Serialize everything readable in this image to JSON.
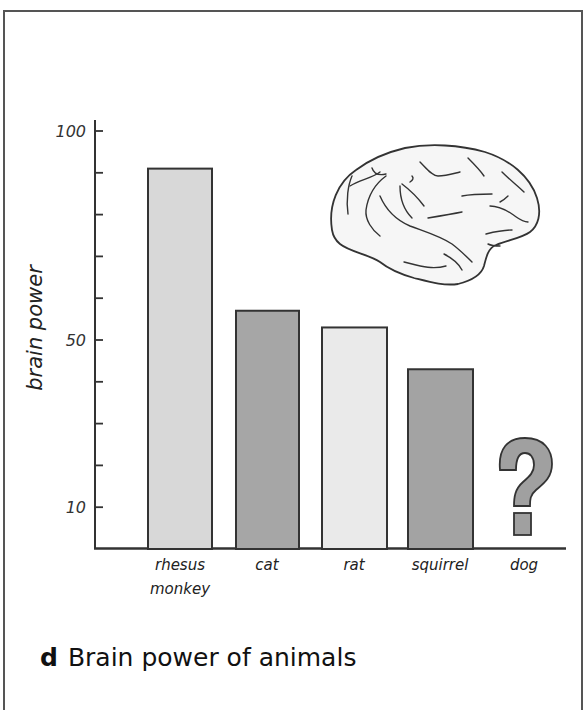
{
  "chart_data": {
    "type": "bar",
    "title": "Brain power of animals",
    "panel_letter": "d",
    "xlabel": "",
    "ylabel": "brain power",
    "categories": [
      "rhesus monkey",
      "cat",
      "rat",
      "squirrel",
      "dog"
    ],
    "values": [
      91,
      57,
      53,
      43,
      null
    ],
    "unknown_marker": {
      "category": "dog",
      "symbol": "?"
    },
    "ylim": [
      0,
      100
    ],
    "yticks_labeled": [
      100,
      50,
      10
    ],
    "yticks_minor": [
      100,
      90,
      80,
      70,
      60,
      50,
      40,
      30,
      20,
      10
    ],
    "grid": false,
    "legend": null,
    "bar_colors": [
      "#d8d8d8",
      "#a6a6a6",
      "#eaeaea",
      "#a3a3a3"
    ],
    "decoration": "brain illustration (lateral view) top right"
  },
  "axis": {
    "ylabel": "brain power",
    "tick_labels": [
      "100",
      "50",
      "10"
    ]
  },
  "bars": [
    {
      "label": "rhesus\nmonkey",
      "value": 91,
      "color": "#d8d8d8"
    },
    {
      "label": "cat",
      "value": 57,
      "color": "#a6a6a6"
    },
    {
      "label": "rat",
      "value": 53,
      "color": "#eaeaea"
    },
    {
      "label": "squirrel",
      "value": 43,
      "color": "#a3a3a3"
    },
    {
      "label": "dog",
      "value": null,
      "color": "#a0a0a0"
    }
  ],
  "caption": {
    "letter": "d",
    "text": "Brain power of animals"
  },
  "question_mark": "?"
}
